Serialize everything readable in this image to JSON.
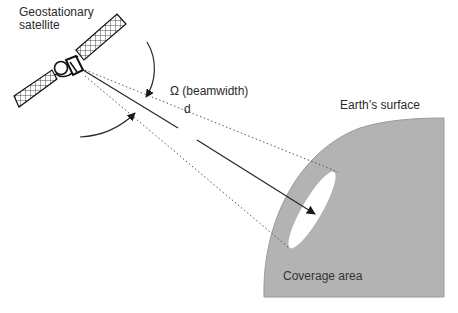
{
  "diagram": {
    "labels": {
      "satellite": [
        "Geostationary",
        "satellite"
      ],
      "beamwidth": "Ω (beamwidth)",
      "distance": "d",
      "earth_surface": "Earth’s surface",
      "coverage_area": "Coverage area"
    },
    "elements": [
      {
        "id": "satellite",
        "icon": "satellite-icon",
        "position": [
          62,
          66
        ]
      },
      {
        "id": "beam-upper-edge",
        "style": "dotted",
        "from": [
          85,
          70
        ],
        "to": [
          338,
          172
        ]
      },
      {
        "id": "beam-lower-edge",
        "style": "dotted",
        "from": [
          85,
          75
        ],
        "to": [
          288,
          247
        ]
      },
      {
        "id": "distance-arrow",
        "style": "solid-arrow",
        "from": [
          83,
          70
        ],
        "to": [
          315,
          215
        ],
        "label": "d"
      },
      {
        "id": "beamwidth-arc-upper",
        "style": "curved-arrow",
        "from": [
          147,
          42
        ],
        "to": [
          146,
          97
        ]
      },
      {
        "id": "beamwidth-arc-lower",
        "style": "curved-arrow",
        "from": [
          80,
          137
        ],
        "to": [
          135,
          113
        ]
      },
      {
        "id": "earth-surface",
        "fill": "#b3b3b3"
      },
      {
        "id": "coverage-area",
        "shape": "ellipse",
        "fill": "#ffffff"
      }
    ],
    "colors": {
      "background": "#ffffff",
      "earth_fill": "#b3b3b3",
      "earth_edge": "#9a9a9a",
      "line": "#2a2a2a",
      "dotted_line": "#555555",
      "coverage_fill": "#ffffff"
    }
  }
}
